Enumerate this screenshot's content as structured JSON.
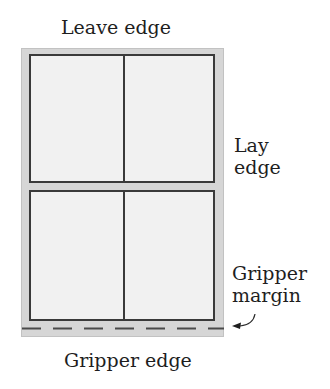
{
  "labels": {
    "top": "Leave edge",
    "right": [
      "Lay",
      "edge"
    ],
    "margin": [
      "Gripper",
      "margin"
    ],
    "bottom": "Gripper edge"
  },
  "diagram": {
    "sheet_color": "#d6d6d6",
    "panel_color": "#f1f1f1",
    "line_color": "#3a3a3a",
    "panels": [
      {
        "name": "top",
        "columns": 2
      },
      {
        "name": "bottom",
        "columns": 2
      }
    ],
    "gripper_line_style": "dashed"
  }
}
